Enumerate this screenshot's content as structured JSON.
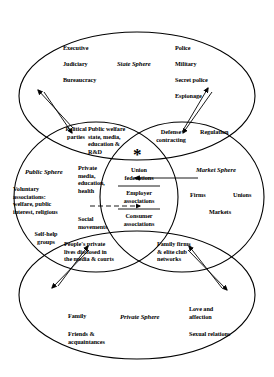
{
  "diagram": {
    "type": "venn-four-ellipse",
    "center_marker": "*",
    "spheres": [
      {
        "id": "state",
        "name": "State Sphere",
        "items": [
          "Executive",
          "Judiciary",
          "Bureaucracy",
          "Police",
          "Military",
          "Secret police",
          "Espionage"
        ]
      },
      {
        "id": "public",
        "name": "Public Sphere",
        "items": [
          "Voluntary\nassociations:\nwelfare, public\ninterest, religious",
          "Self-help\ngroups",
          "Social\nmovements"
        ]
      },
      {
        "id": "market",
        "name": "Market Sphere",
        "items": [
          "Firms",
          "Unions",
          "Markets"
        ]
      },
      {
        "id": "private",
        "name": "Private Sphere",
        "items": [
          "Family",
          "Friends &\nacquaintances",
          "Love and\naffection",
          "Sexual relations"
        ]
      }
    ],
    "overlaps": [
      {
        "id": "state-public",
        "label": "Political\nparties"
      },
      {
        "id": "state-public-core",
        "label": "Public welfare\nstate, media,\neducation &\nR&D"
      },
      {
        "id": "state-market",
        "label": "Defense\ncontracting"
      },
      {
        "id": "state-market-outer",
        "label": "Regulation"
      },
      {
        "id": "public-core",
        "label": "Private\nmedia,\neducation,\nhealth"
      },
      {
        "id": "public-market-union",
        "label": "Union\nfederations"
      },
      {
        "id": "public-market-employer",
        "label": "Employer\nassociations"
      },
      {
        "id": "public-market-consumer",
        "label": "Consumer\nassociations"
      },
      {
        "id": "public-private",
        "label": "People's private\nlives disclosed in\nthe media & courts"
      },
      {
        "id": "market-private",
        "label": "Family firms\n& elite club\nnetworks"
      }
    ]
  }
}
